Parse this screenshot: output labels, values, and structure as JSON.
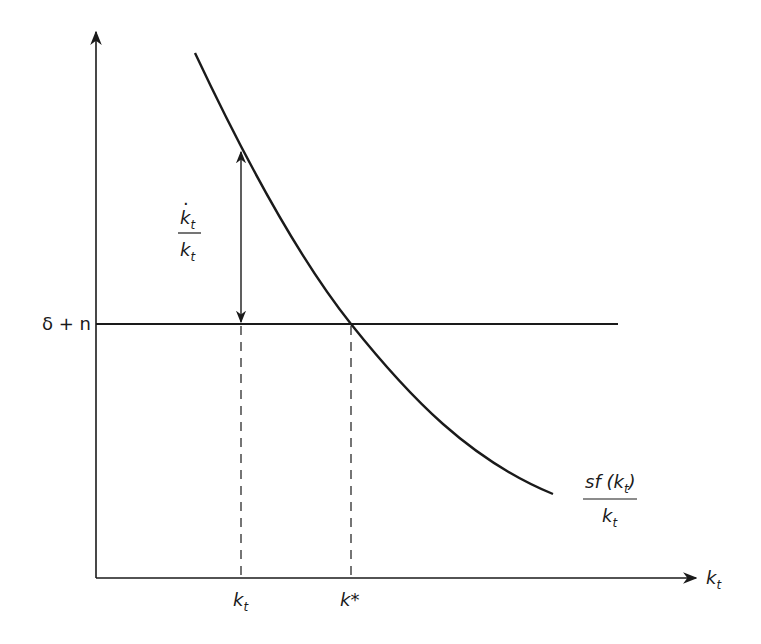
{
  "diagram": {
    "x_axis": {
      "label": "k",
      "label_sub": "t"
    },
    "y_axis": {
      "label": ""
    },
    "horizontal_line": {
      "label": "δ + n"
    },
    "curve": {
      "label_num_main": "sf (k",
      "label_num_sub": "t",
      "label_num_close": ")",
      "label_den_main": "k",
      "label_den_sub": "t"
    },
    "growth_arrow": {
      "label_num_main": "k",
      "label_num_sub": "t",
      "label_num_dot": "·",
      "label_den_main": "k",
      "label_den_sub": "t"
    },
    "markers": [
      {
        "name": "kt",
        "label_main": "k",
        "label_sub": "t",
        "style": "dashed"
      },
      {
        "name": "kstar",
        "label_main": "k*",
        "label_sub": "",
        "style": "dashed"
      }
    ],
    "colors": {
      "ink": "#1a1a1a",
      "background": "#ffffff"
    }
  }
}
